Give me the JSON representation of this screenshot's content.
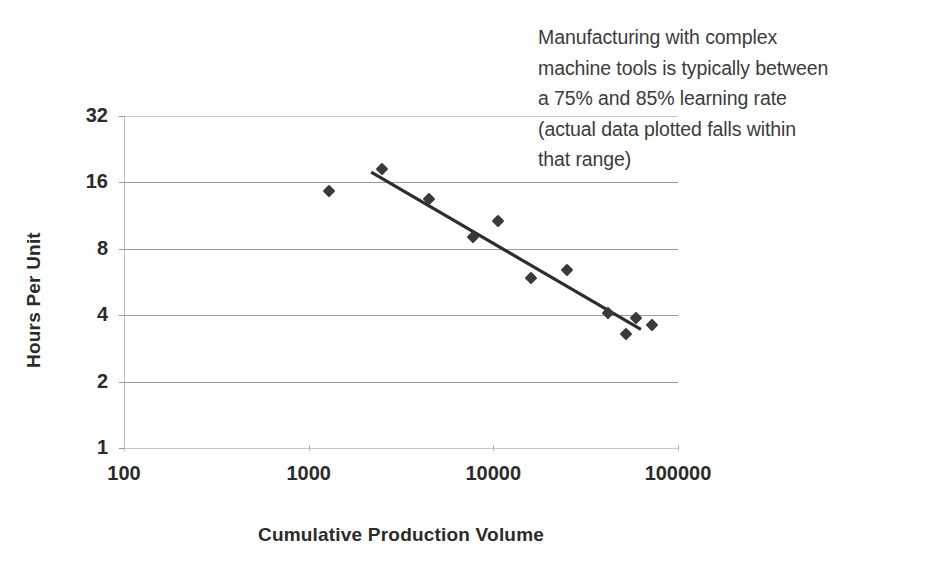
{
  "annotation": {
    "text": "Manufacturing with complex\nmachine tools is typically between\na 75% and 85% learning rate\n(actual data plotted falls within\nthat range)"
  },
  "axes": {
    "ylabel": "Hours Per Unit",
    "xlabel": "Cumulative Production Volume",
    "ytick_labels": [
      "32",
      "16",
      "8",
      "4",
      "2",
      "1"
    ],
    "xtick_labels": [
      "100",
      "1000",
      "10000",
      "100000"
    ]
  },
  "colors": {
    "marker": "#3a3a3a",
    "trendline": "#2e2e2e",
    "gridline": "#9a9a9a",
    "text": "#2b2b2b",
    "annotation_text": "#3b3b3b",
    "background": "#ffffff"
  },
  "chart_data": {
    "type": "scatter",
    "title": "",
    "subtitle": "",
    "xlabel": "Cumulative Production Volume",
    "ylabel": "Hours Per Unit",
    "xscale": "log",
    "yscale": "log",
    "xlim": [
      100,
      100000
    ],
    "ylim": [
      1,
      32
    ],
    "xticks": [
      100,
      1000,
      10000,
      100000
    ],
    "yticks": [
      1,
      2,
      4,
      8,
      16,
      32
    ],
    "grid": "horizontal",
    "legend": "none",
    "annotations": [
      {
        "text": "Manufacturing with complex machine tools is typically between a 75% and 85% learning rate (actual data plotted falls within that range)",
        "position": "top-right"
      }
    ],
    "series": [
      {
        "name": "Actual data",
        "type": "scatter",
        "marker": "diamond",
        "points": [
          {
            "x": 1290,
            "y": 14.6
          },
          {
            "x": 2500,
            "y": 18.5
          },
          {
            "x": 4500,
            "y": 13.4
          },
          {
            "x": 7800,
            "y": 9.1
          },
          {
            "x": 10600,
            "y": 10.7
          },
          {
            "x": 16000,
            "y": 5.9
          },
          {
            "x": 25000,
            "y": 6.4
          },
          {
            "x": 42000,
            "y": 4.1
          },
          {
            "x": 52000,
            "y": 3.3
          },
          {
            "x": 59000,
            "y": 3.9
          },
          {
            "x": 72000,
            "y": 3.6
          }
        ]
      },
      {
        "name": "Trend line",
        "type": "line",
        "points": [
          {
            "x": 2180,
            "y": 17.8
          },
          {
            "x": 63000,
            "y": 3.45
          }
        ]
      }
    ]
  }
}
